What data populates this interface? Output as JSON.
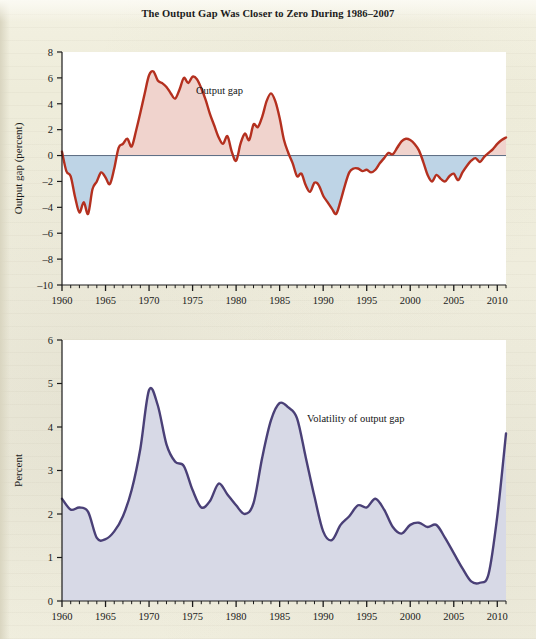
{
  "figure": {
    "title": "The Output Gap Was Closer to Zero During 1986–2007",
    "background_color": "#efeddc"
  },
  "chart_data": [
    {
      "type": "area",
      "title": "The Output Gap Was Closer to Zero During 1986–2007",
      "xlabel": "",
      "ylabel": "Output gap (percent)",
      "annotation": "Output gap",
      "line_color": "#b4301f",
      "fill_positive_color": "#f0d3cd",
      "fill_negative_color": "#bed4e6",
      "xlim": [
        1960,
        2011
      ],
      "ylim": [
        -10,
        8
      ],
      "xticks": [
        1960,
        1965,
        1970,
        1975,
        1980,
        1985,
        1990,
        1995,
        2000,
        2005,
        2010
      ],
      "yticks": [
        -10,
        -8,
        -6,
        -4,
        -2,
        0,
        2,
        4,
        6,
        8
      ],
      "minor_xtick_interval": 1,
      "grid": false,
      "zero_line": 0,
      "x": [
        1960.0,
        1960.5,
        1961.0,
        1961.5,
        1962.0,
        1962.5,
        1963.0,
        1963.5,
        1964.0,
        1964.5,
        1965.0,
        1965.5,
        1966.0,
        1966.5,
        1967.0,
        1967.5,
        1968.0,
        1968.5,
        1969.0,
        1969.5,
        1970.0,
        1970.5,
        1971.0,
        1971.5,
        1972.0,
        1972.5,
        1973.0,
        1973.5,
        1974.0,
        1974.5,
        1975.0,
        1975.5,
        1976.0,
        1976.5,
        1977.0,
        1977.5,
        1978.0,
        1978.5,
        1979.0,
        1979.5,
        1980.0,
        1980.5,
        1981.0,
        1981.5,
        1982.0,
        1982.5,
        1983.0,
        1983.5,
        1984.0,
        1984.5,
        1985.0,
        1985.5,
        1986.0,
        1986.5,
        1987.0,
        1987.5,
        1988.0,
        1988.5,
        1989.0,
        1989.5,
        1990.0,
        1990.5,
        1991.0,
        1991.5,
        1992.0,
        1992.5,
        1993.0,
        1993.5,
        1994.0,
        1994.5,
        1995.0,
        1995.5,
        1996.0,
        1996.5,
        1997.0,
        1997.5,
        1998.0,
        1998.5,
        1999.0,
        1999.5,
        2000.0,
        2000.5,
        2001.0,
        2001.5,
        2002.0,
        2002.5,
        2003.0,
        2003.5,
        2004.0,
        2004.5,
        2005.0,
        2005.5,
        2006.0,
        2006.5,
        2007.0,
        2007.5,
        2008.0,
        2008.5,
        2009.0,
        2009.5,
        2010.0,
        2010.5,
        2011.0
      ],
      "y": [
        0.3,
        -1.2,
        -1.6,
        -3.2,
        -4.4,
        -3.6,
        -4.5,
        -2.6,
        -2.0,
        -1.3,
        -1.7,
        -2.2,
        -1.0,
        0.6,
        0.9,
        1.3,
        0.7,
        1.9,
        3.3,
        4.8,
        6.2,
        6.5,
        5.8,
        5.6,
        5.3,
        4.8,
        4.4,
        5.1,
        6.0,
        5.6,
        6.1,
        5.9,
        5.2,
        4.3,
        3.2,
        2.3,
        1.4,
        0.9,
        1.5,
        0.3,
        -0.4,
        0.9,
        1.7,
        1.2,
        2.4,
        2.2,
        3.0,
        4.2,
        4.8,
        4.2,
        2.9,
        1.2,
        0.2,
        -0.6,
        -1.6,
        -1.4,
        -2.3,
        -2.8,
        -2.1,
        -2.3,
        -3.1,
        -3.6,
        -4.1,
        -4.5,
        -3.5,
        -2.3,
        -1.3,
        -1.0,
        -1.0,
        -1.2,
        -1.1,
        -1.3,
        -1.1,
        -0.6,
        -0.2,
        0.2,
        0.1,
        0.6,
        1.1,
        1.3,
        1.2,
        0.9,
        0.4,
        -0.5,
        -1.5,
        -2.0,
        -1.5,
        -1.8,
        -2.0,
        -1.6,
        -1.4,
        -1.9,
        -1.3,
        -0.8,
        -0.4,
        -0.2,
        -0.5,
        -0.1,
        0.2,
        0.5,
        0.9,
        1.2,
        1.4
      ]
    },
    {
      "type": "area",
      "title": "",
      "xlabel": "",
      "ylabel": "Percent",
      "annotation": "Volatility of output gap",
      "line_color": "#4a4077",
      "fill_color": "#d7d9e6",
      "xlim": [
        1960,
        2011
      ],
      "ylim": [
        0,
        6
      ],
      "xticks": [
        1960,
        1965,
        1970,
        1975,
        1980,
        1985,
        1990,
        1995,
        2000,
        2005,
        2010
      ],
      "yticks": [
        0,
        1,
        2,
        3,
        4,
        5,
        6
      ],
      "minor_xtick_interval": 1,
      "grid": false,
      "x": [
        1960,
        1961,
        1962,
        1963,
        1964,
        1965,
        1966,
        1967,
        1968,
        1969,
        1970,
        1971,
        1972,
        1973,
        1974,
        1975,
        1976,
        1977,
        1978,
        1979,
        1980,
        1981,
        1982,
        1983,
        1984,
        1985,
        1986,
        1987,
        1988,
        1989,
        1990,
        1991,
        1992,
        1993,
        1994,
        1995,
        1996,
        1997,
        1998,
        1999,
        2000,
        2001,
        2002,
        2003,
        2004,
        2005,
        2006,
        2007,
        2008,
        2009,
        2010,
        2011
      ],
      "y": [
        2.35,
        2.1,
        2.15,
        2.05,
        1.45,
        1.42,
        1.6,
        1.95,
        2.55,
        3.5,
        4.85,
        4.5,
        3.6,
        3.2,
        3.1,
        2.55,
        2.15,
        2.3,
        2.7,
        2.45,
        2.2,
        2.0,
        2.25,
        3.3,
        4.15,
        4.55,
        4.45,
        4.2,
        3.3,
        2.4,
        1.6,
        1.4,
        1.75,
        1.95,
        2.2,
        2.15,
        2.35,
        2.1,
        1.7,
        1.55,
        1.75,
        1.8,
        1.7,
        1.75,
        1.45,
        1.1,
        0.75,
        0.45,
        0.42,
        0.62,
        1.95,
        3.85
      ]
    }
  ],
  "chart1": {
    "title": "The Output Gap Was Closer to Zero During 1986–2007",
    "ylabel": "Output gap (percent)",
    "annotation": "Output gap",
    "yticks": [
      "8",
      "6",
      "4",
      "2",
      "0",
      "–2",
      "–4",
      "–6",
      "–8",
      "–10"
    ],
    "xticks": [
      "1960",
      "1965",
      "1970",
      "1975",
      "1980",
      "1985",
      "1990",
      "1995",
      "2000",
      "2005",
      "2010"
    ]
  },
  "chart2": {
    "ylabel": "Percent",
    "annotation": "Volatility of output gap",
    "yticks": [
      "6",
      "5",
      "4",
      "3",
      "2",
      "1",
      "0"
    ],
    "xticks": [
      "1960",
      "1965",
      "1970",
      "1975",
      "1980",
      "1985",
      "1990",
      "1995",
      "2000",
      "2005",
      "2010"
    ]
  }
}
